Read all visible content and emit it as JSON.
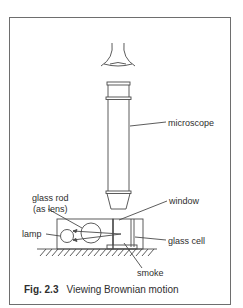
{
  "figure": {
    "number_label": "Fig. 2.3",
    "title": "Viewing Brownian motion"
  },
  "labels": {
    "microscope": "microscope",
    "window": "window",
    "glass_rod_line1": "glass rod",
    "glass_rod_line2": "(as lens)",
    "lamp": "lamp",
    "glass_cell": "glass cell",
    "smoke": "smoke"
  },
  "colors": {
    "line": "#4a4a4a",
    "frame": "#6e6e6e",
    "background": "#ffffff"
  }
}
